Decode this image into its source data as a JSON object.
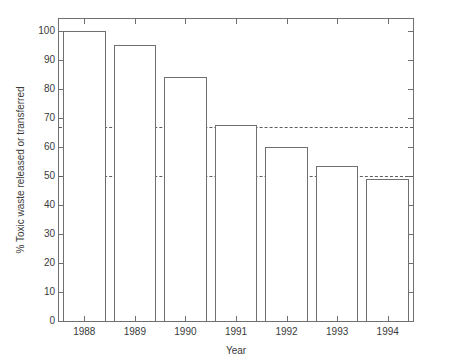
{
  "chart_data": {
    "type": "bar",
    "title": "",
    "xlabel": "Year",
    "ylabel": "% Toxic waste released or transferred",
    "categories": [
      "1988",
      "1989",
      "1990",
      "1991",
      "1992",
      "1993",
      "1994"
    ],
    "values": [
      100,
      95,
      84,
      67.5,
      60,
      53.5,
      49
    ],
    "ylim": [
      0,
      104
    ],
    "xlim": [
      1987.4,
      1994.9
    ],
    "yticks": [
      0,
      10,
      20,
      30,
      40,
      50,
      60,
      70,
      80,
      90,
      100
    ],
    "ytick_labels": [
      "0",
      "10",
      "20",
      "30",
      "40",
      "50",
      "60",
      "70",
      "80",
      "90",
      "100"
    ],
    "xticks": [
      "1988",
      "1989",
      "1990",
      "1991",
      "1992",
      "1993",
      "1994"
    ],
    "grid": false,
    "legend": null,
    "annotations": [
      {
        "kind": "hline",
        "value": 66.7,
        "style": "dashed",
        "label": ""
      },
      {
        "kind": "hline",
        "value": 50,
        "style": "dashed",
        "label": ""
      }
    ],
    "bar_style": {
      "face_color": "#ffffff",
      "edge_color": "#6f6f6f",
      "bar_width_fraction": 0.84
    },
    "axes_color": "#6f6f6f",
    "reference_line_color": "#5e5e5e",
    "background_color": "#ffffff"
  }
}
